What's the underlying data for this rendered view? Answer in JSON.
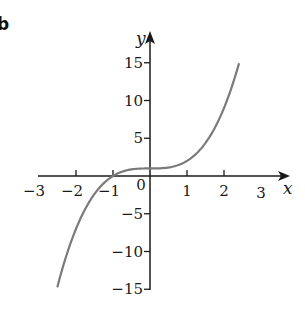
{
  "panel_label": "b",
  "chart_data": {
    "type": "line",
    "title": "",
    "xlabel": "x",
    "ylabel": "y",
    "xlim": [
      -3,
      3
    ],
    "ylim": [
      -15,
      15
    ],
    "grid": false,
    "legend": null,
    "function": "y = x^3 + 1",
    "x_ticks": [
      -2,
      -1,
      1,
      2
    ],
    "x_tick_labels": [
      "−3",
      "−2",
      "−1",
      "0",
      "1",
      "2",
      "3"
    ],
    "y_ticks": [
      -15,
      -10,
      -5,
      5,
      10,
      15
    ],
    "y_tick_labels": [
      "15",
      "10",
      "5",
      "−5",
      "−10",
      "−15"
    ],
    "series": [
      {
        "name": "y = x^3 + 1",
        "color": "#7a7a7a",
        "x": [
          -2.5,
          -2.25,
          -2,
          -1.75,
          -1.5,
          -1.25,
          -1,
          -0.75,
          -0.5,
          -0.25,
          0,
          0.25,
          0.5,
          0.75,
          1,
          1.25,
          1.5,
          1.75,
          2,
          2.25,
          2.4
        ],
        "values": [
          -14.63,
          -10.39,
          -7,
          -4.36,
          -2.38,
          -0.95,
          0,
          0.58,
          0.88,
          0.98,
          1,
          1.02,
          1.13,
          1.42,
          2,
          2.95,
          4.38,
          6.36,
          9,
          12.39,
          14.82
        ]
      }
    ]
  },
  "style": {
    "axis_color": "#1a1a1a",
    "curve_color": "#7a7a7a"
  }
}
